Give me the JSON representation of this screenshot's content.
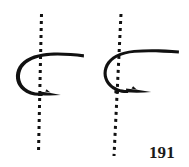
{
  "figure": {
    "number_label": "191",
    "caption": "",
    "background_color": "#ffffff",
    "ink_color": "#111111",
    "width": 189,
    "height": 167
  },
  "diagram": {
    "title": "",
    "type": "technical-line-illustration",
    "items": [
      {
        "name": "hook-left",
        "label": "",
        "axis_line": {
          "name": "dashed-axis-left",
          "style": "dashed",
          "orientation": "vertical",
          "x_top": 41,
          "y_top": 14,
          "x_bottom": 38,
          "y_bottom": 152,
          "color": "#111111",
          "dash_on": 3,
          "dash_off": 4,
          "width": 3
        },
        "hook": {
          "name": "hook-shape-left",
          "shank_tip_x": 84,
          "shank_y": 55,
          "bend_left_x": 16,
          "point_tip_x": 60,
          "point_y": 92,
          "has_barb": true
        }
      },
      {
        "name": "hook-right",
        "label": "",
        "axis_line": {
          "name": "dashed-axis-right",
          "style": "dashed",
          "orientation": "vertical",
          "x_top": 120,
          "y_top": 14,
          "x_bottom": 114,
          "y_bottom": 156,
          "color": "#111111",
          "dash_on": 3,
          "dash_off": 4,
          "width": 3
        },
        "hook": {
          "name": "hook-shape-right",
          "shank_tip_x": 179,
          "shank_y": 51,
          "bend_left_x": 104,
          "point_tip_x": 151,
          "point_y": 89,
          "has_barb": true
        }
      }
    ]
  }
}
